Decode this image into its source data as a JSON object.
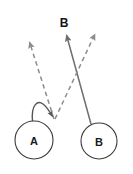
{
  "canvas": {
    "width": 133,
    "height": 174,
    "background": "#ffffff"
  },
  "colors": {
    "node_stroke": "#3a3a3a",
    "node_fill": "#ffffff",
    "solid_edge": "#6e6e6e",
    "dashed_edge": "#8c8c8c",
    "curve_edge": "#555555",
    "label_text": "#1a1a1a"
  },
  "nodes": [
    {
      "id": "node-a",
      "label": "A",
      "cx": 34,
      "cy": 140,
      "r": 19
    },
    {
      "id": "node-b",
      "label": "B",
      "cx": 99,
      "cy": 141,
      "r": 18
    }
  ],
  "target_marker": {
    "id": "target-b",
    "label": "B",
    "x": 64,
    "y": 23
  },
  "edges": [
    {
      "id": "solid-edge-b-to-target",
      "style": "solid",
      "from": "node-b",
      "to": "target-b",
      "x1": 91,
      "y1": 124,
      "x2": 65.5,
      "y2": 32,
      "arrow": "end"
    },
    {
      "id": "self-loop-a",
      "style": "solid-curve",
      "from": "node-a",
      "to": "convergence-point",
      "arrow": "end"
    },
    {
      "id": "dashed-edge-up-left",
      "style": "dashed",
      "from": "convergence-point",
      "to": "up-left",
      "x1": 54,
      "y1": 119,
      "x2": 27.5,
      "y2": 38.5,
      "arrow": "end"
    },
    {
      "id": "dashed-edge-up-right",
      "style": "dashed",
      "from": "convergence-point",
      "to": "up-right",
      "x1": 55,
      "y1": 119,
      "x2": 97,
      "y2": 30,
      "arrow": "end"
    }
  ]
}
